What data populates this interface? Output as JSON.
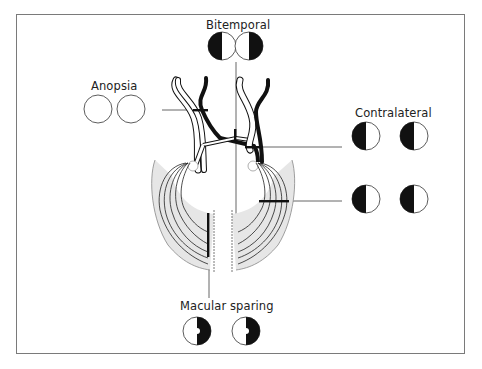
{
  "labels": {
    "bitemporal": "Bitemporal",
    "anopsia": "Anopsia",
    "contralateral": "Contralateral",
    "macular_sparing": "Macular sparing"
  },
  "visual_fields": [
    {
      "group": "Bitemporal",
      "left_eye": "left half black",
      "right_eye": "right half black"
    },
    {
      "group": "Anopsia",
      "left_eye": "all white (blind)",
      "right_eye": "all white (blind)"
    },
    {
      "group": "Contralateral",
      "left_eye": "left half black",
      "right_eye": "left half black"
    },
    {
      "group": "Optic radiation lesion",
      "left_eye": "left half black",
      "right_eye": "left half black"
    },
    {
      "group": "Macular sparing",
      "left_eye": "right half black with central sparing",
      "right_eye": "right half black with central sparing"
    }
  ],
  "colors": {
    "frame": "#7a7a7a",
    "ink": "#111111",
    "pointer": "#555555",
    "cortex_shade": "#e6e6e6"
  }
}
